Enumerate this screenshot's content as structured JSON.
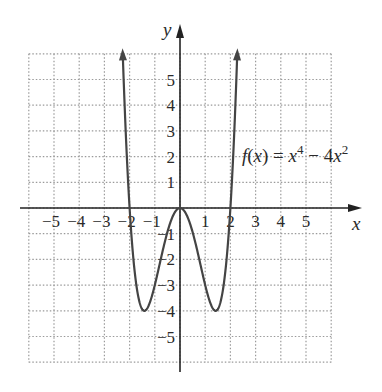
{
  "chart_data": {
    "type": "line",
    "title": "",
    "function": "f(x) = x^4 - 4x^2",
    "label": {
      "prefix": "f",
      "arg": "(x) = x",
      "exp1": "4",
      "mid": " − 4x",
      "exp2": "2"
    },
    "xlabel": "x",
    "ylabel": "y",
    "xlim": [
      -6,
      6
    ],
    "ylim": [
      -6,
      6
    ],
    "grid": true,
    "grid_style": "dotted",
    "x_ticks": [
      -5,
      -4,
      -3,
      -2,
      -1,
      1,
      2,
      3,
      4,
      5
    ],
    "x_tick_labels": [
      "−5",
      "−4",
      "−3",
      "−2",
      "−1",
      "1",
      "2",
      "3",
      "4",
      "5"
    ],
    "y_ticks": [
      5,
      4,
      3,
      2,
      1,
      -1,
      -2,
      -3,
      -4,
      -5
    ],
    "y_tick_labels": [
      "5",
      "4",
      "3",
      "2",
      "1",
      "−1",
      "−2",
      "−3",
      "−4",
      "−5"
    ],
    "domain_shown": [
      -2.6,
      2.6
    ],
    "end_arrows": true,
    "key_points": [
      {
        "x": -2,
        "y": 0
      },
      {
        "x": -1.414,
        "y": -4
      },
      {
        "x": 0,
        "y": 0
      },
      {
        "x": 1.414,
        "y": -4
      },
      {
        "x": 2,
        "y": 0
      }
    ],
    "sample_points": {
      "x": [
        -2.6,
        -2.4,
        -2.2,
        -2.0,
        -1.8,
        -1.6,
        -1.414,
        -1.2,
        -1.0,
        -0.8,
        -0.6,
        -0.4,
        -0.2,
        0,
        0.2,
        0.4,
        0.6,
        0.8,
        1.0,
        1.2,
        1.414,
        1.6,
        1.8,
        2.0,
        2.2,
        2.4,
        2.6
      ],
      "y": [
        18.66,
        10.14,
        4.06,
        0,
        -2.46,
        -3.69,
        -4,
        -3.69,
        -3,
        -2.15,
        -1.31,
        -0.61,
        -0.16,
        0,
        -0.16,
        -0.61,
        -1.31,
        -2.15,
        -3,
        -3.69,
        -4,
        -3.69,
        -2.46,
        0,
        4.06,
        10.14,
        18.66
      ]
    },
    "colors": {
      "curve": "#444444",
      "axes": "#222222",
      "grid": "#9a9a9a",
      "text": "#2a2a2a"
    }
  }
}
